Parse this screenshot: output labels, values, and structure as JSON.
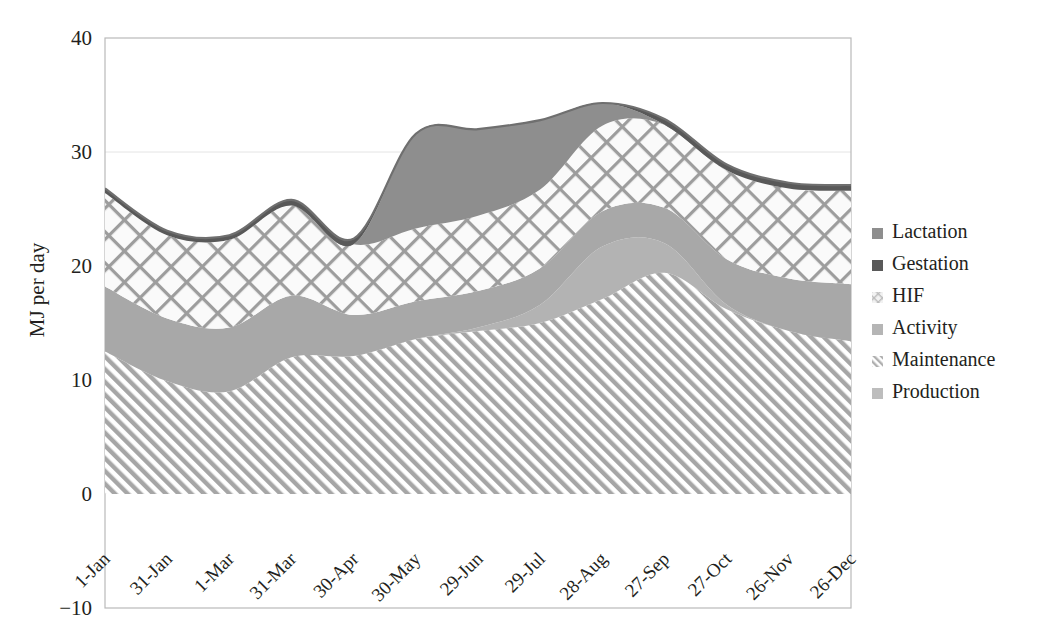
{
  "chart_data": {
    "type": "area",
    "title": "",
    "subtitle": "",
    "xlabel": "",
    "ylabel": "MJ per day",
    "ylim": [
      -10,
      40
    ],
    "yticks": [
      -10,
      0,
      10,
      20,
      30,
      40
    ],
    "ytick_labels": [
      "−10",
      "0",
      "10",
      "20",
      "30",
      "40"
    ],
    "grid": false,
    "legend_position": "right",
    "stacking": "stacked-area",
    "x": [
      "1-Jan",
      "31-Jan",
      "1-Mar",
      "31-Mar",
      "30-Apr",
      "30-May",
      "29-Jun",
      "29-Jul",
      "28-Aug",
      "27-Sep",
      "27-Oct",
      "26-Nov",
      "26-Dec"
    ],
    "categories": [
      "1-Jan",
      "31-Jan",
      "1-Mar",
      "31-Mar",
      "30-Apr",
      "30-May",
      "29-Jun",
      "29-Jul",
      "28-Aug",
      "27-Sep",
      "27-Oct",
      "26-Nov",
      "26-Dec"
    ],
    "series": [
      {
        "name": "Maintenance",
        "pattern": "diagonal-hatch",
        "color": "#a6a6a6",
        "values": [
          12.5,
          9.9,
          9.0,
          12.0,
          12.1,
          13.6,
          14.3,
          15.0,
          17.1,
          19.4,
          16.2,
          14.3,
          13.4
        ]
      },
      {
        "name": "Production",
        "pattern": "solid",
        "color": "#b3b3b3",
        "values": [
          0.0,
          0.0,
          0.0,
          0.0,
          0.0,
          0.0,
          0.3,
          1.6,
          4.6,
          2.6,
          0.4,
          0.0,
          0.0
        ]
      },
      {
        "name": "Activity",
        "pattern": "solid",
        "color": "#a8a8a8",
        "values": [
          5.7,
          5.5,
          5.6,
          5.4,
          3.6,
          3.3,
          3.2,
          3.2,
          3.1,
          3.1,
          4.0,
          4.6,
          5.0
        ]
      },
      {
        "name": "HIF",
        "pattern": "crosshatch",
        "color": "#a0a0a0",
        "values": [
          8.2,
          7.3,
          7.7,
          7.9,
          6.2,
          6.4,
          6.6,
          6.9,
          7.5,
          7.3,
          7.8,
          7.9,
          8.2
        ]
      },
      {
        "name": "Lactation",
        "pattern": "solid",
        "color": "#8e8e8e",
        "values": [
          0.0,
          0.0,
          0.0,
          0.0,
          0.0,
          8.3,
          7.6,
          6.1,
          2.0,
          0.0,
          0.0,
          0.0,
          0.0
        ]
      },
      {
        "name": "Gestation",
        "pattern": "solid",
        "color": "#595959",
        "values": [
          0.4,
          0.4,
          0.4,
          0.5,
          0.5,
          0.0,
          0.0,
          0.0,
          0.0,
          0.5,
          0.5,
          0.5,
          0.5
        ]
      }
    ],
    "annotations": [
      "Lactation begins abruptly at approximately 30-May (step change in stack top from ~24.6 to ~33.6 MJ per day)",
      "Stack top peaks near 30-May at ~33.6 and again near 28-Aug at ~32.3 MJ per day",
      "Stack top minimum near 31-Jan at ~22.9 MJ per day"
    ]
  },
  "axes": {
    "y_title": "MJ per day",
    "y_ticks": [
      {
        "value": 40,
        "label": "40"
      },
      {
        "value": 30,
        "label": "30"
      },
      {
        "value": 20,
        "label": "20"
      },
      {
        "value": 10,
        "label": "10"
      },
      {
        "value": 0,
        "label": "0"
      },
      {
        "value": -10,
        "label": "−10"
      }
    ],
    "x_ticks": [
      {
        "label": "1-Jan"
      },
      {
        "label": "31-Jan"
      },
      {
        "label": "1-Mar"
      },
      {
        "label": "31-Mar"
      },
      {
        "label": "30-Apr"
      },
      {
        "label": "30-May"
      },
      {
        "label": "29-Jun"
      },
      {
        "label": "29-Jul"
      },
      {
        "label": "28-Aug"
      },
      {
        "label": "27-Sep"
      },
      {
        "label": "27-Oct"
      },
      {
        "label": "26-Nov"
      },
      {
        "label": "26-Dec"
      }
    ]
  },
  "legend": {
    "items": [
      {
        "label": "Lactation",
        "swatch": "#8e8e8e",
        "swatch_style": "solid"
      },
      {
        "label": "Gestation",
        "swatch": "#595959",
        "swatch_style": "solid"
      },
      {
        "label": "HIF",
        "swatch": "#d8d8d8",
        "swatch_style": "crosshatch"
      },
      {
        "label": "Activity",
        "swatch": "#b5b5b5",
        "swatch_style": "solid"
      },
      {
        "label": "Maintenance",
        "swatch": "#c9c9c9",
        "swatch_style": "diagonal-hatch"
      },
      {
        "label": "Production",
        "swatch": "#bdbdbd",
        "swatch_style": "solid"
      }
    ]
  },
  "colors": {
    "frame": "#b9b9b9",
    "text": "#231f20",
    "background": "#ffffff"
  }
}
